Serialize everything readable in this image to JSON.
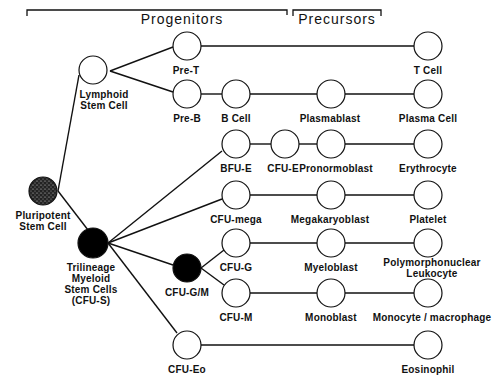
{
  "headers": {
    "progenitors": "Progenitors",
    "precursors": "Precursors"
  },
  "nodes": {
    "pluripotent": {
      "line1": "Pluripotent",
      "line2": "Stem Cell",
      "fill": "stippled"
    },
    "lymphoid": {
      "line1": "Lymphoid",
      "line2": "Stem Cell",
      "fill": "white"
    },
    "trilineage": {
      "line1": "Trilineage",
      "line2": "Myeloid",
      "line3": "Stem Cells",
      "line4": "(CFU-S)",
      "fill": "black"
    },
    "pre_t": {
      "label": "Pre-T"
    },
    "t_cell": {
      "label": "T Cell"
    },
    "pre_b": {
      "label": "Pre-B"
    },
    "b_cell": {
      "label": "B Cell"
    },
    "plasmablast": {
      "label": "Plasmablast"
    },
    "plasma_cell": {
      "label": "Plasma Cell"
    },
    "bfu_e": {
      "label": "BFU-E"
    },
    "cfu_e": {
      "label": "CFU-E"
    },
    "pronormoblast": {
      "label": "Pronormoblast"
    },
    "erythrocyte": {
      "label": "Erythrocyte"
    },
    "cfu_mega": {
      "label": "CFU-mega"
    },
    "megakaryoblast": {
      "label": "Megakaryoblast"
    },
    "platelet": {
      "label": "Platelet"
    },
    "cfu_gm": {
      "label": "CFU-G/M",
      "fill": "black"
    },
    "cfu_g": {
      "label": "CFU-G"
    },
    "myeloblast": {
      "label": "Myeloblast"
    },
    "pmn": {
      "line1": "Polymorphonuclear",
      "line2": "Leukocyte"
    },
    "cfu_m": {
      "label": "CFU-M"
    },
    "monoblast": {
      "label": "Monoblast"
    },
    "monocyte": {
      "label": "Monocyte / macrophage"
    },
    "cfu_eo": {
      "label": "CFU-Eo"
    },
    "eosinophil": {
      "label": "Eosinophil"
    }
  },
  "colors": {
    "line": "#111111",
    "node_fill": "#ffffff",
    "node_dark": "#000000"
  }
}
